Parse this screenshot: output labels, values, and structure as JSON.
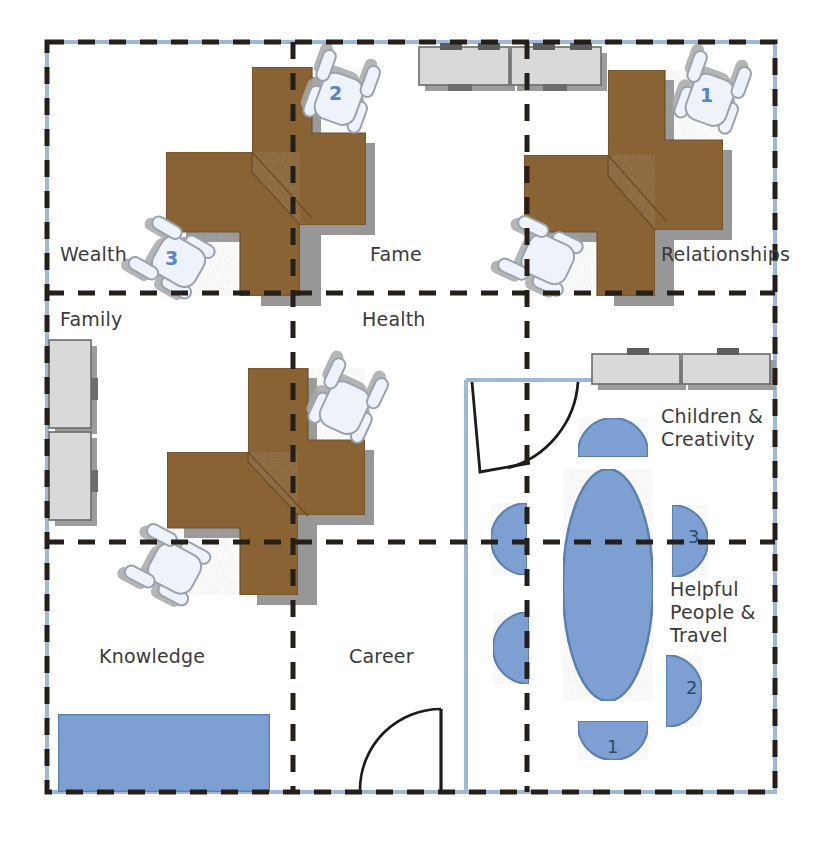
{
  "diagram": {
    "colors": {
      "wall": "#9fb8d8",
      "grid_dash": "#241f18",
      "desk": "#8a6334",
      "desk_shadow": "#8c8c8c",
      "cabinet_fill": "#d9d9d9",
      "cabinet_stroke": "#6b6b6b",
      "chair_fill": "#eef3fb",
      "chair_stroke": "#9aa3ad",
      "chair_shadow": "#a8a8a8",
      "furniture_blue": "#7d9fd2",
      "furniture_blue_stroke": "#5c7fb2",
      "text": "#3b3b3b",
      "chair_number": "#5b85c6",
      "seat_number": "#2e4a6e"
    }
  },
  "bagua_labels": [
    {
      "id": "wealth",
      "text": "Wealth",
      "x": 60,
      "y": 243
    },
    {
      "id": "fame",
      "text": "Fame",
      "x": 370,
      "y": 243
    },
    {
      "id": "relationships",
      "text": "Relationships",
      "x": 661,
      "y": 243
    },
    {
      "id": "family",
      "text": "Family",
      "x": 60,
      "y": 308
    },
    {
      "id": "health",
      "text": "Health",
      "x": 362,
      "y": 308
    },
    {
      "id": "children",
      "text": "Children &\nCreativity",
      "x": 661,
      "y": 405
    },
    {
      "id": "knowledge",
      "text": "Knowledge",
      "x": 99,
      "y": 645
    },
    {
      "id": "career",
      "text": "Career",
      "x": 349,
      "y": 645
    },
    {
      "id": "helpful",
      "text": "Helpful\nPeople &\nTravel",
      "x": 670,
      "y": 578
    }
  ],
  "chair_numbers": [
    {
      "id": "chair-2",
      "text": "2",
      "x": 329,
      "y": 82
    },
    {
      "id": "chair-1",
      "text": "1",
      "x": 700,
      "y": 84
    },
    {
      "id": "chair-3",
      "text": "3",
      "x": 165,
      "y": 247
    }
  ],
  "seat_numbers": [
    {
      "id": "seat-3",
      "text": "3",
      "x": 688,
      "y": 526
    },
    {
      "id": "seat-2",
      "text": "2",
      "x": 686,
      "y": 677
    },
    {
      "id": "seat-1",
      "text": "1",
      "x": 607,
      "y": 736
    }
  ],
  "grid": {
    "outer": {
      "x": 47,
      "y": 42,
      "width": 728,
      "height": 750
    },
    "vertical_lines": [
      293,
      527
    ],
    "horizontal_lines": [
      293,
      542
    ]
  },
  "furniture": {
    "desks": [
      {
        "id": "desk-cluster-top",
        "note": "L-shaped paired workstation, upper area"
      },
      {
        "id": "desk-cluster-right",
        "note": "L-shaped paired workstation, upper right"
      },
      {
        "id": "desk-cluster-middle",
        "note": "L-shaped paired workstation, middle"
      }
    ],
    "cabinets": [
      {
        "id": "cabinet-top-left",
        "note": "credenza along top wall, left"
      },
      {
        "id": "cabinet-top-right",
        "note": "credenza along top wall, right"
      },
      {
        "id": "cabinet-left-upper",
        "note": "cabinet along left wall, upper"
      },
      {
        "id": "cabinet-left-lower",
        "note": "cabinet along left wall, lower"
      },
      {
        "id": "cabinet-right-a",
        "note": "credenza along right room top wall, left"
      },
      {
        "id": "cabinet-right-b",
        "note": "credenza along right room top wall, right"
      }
    ],
    "chairs": [
      {
        "id": "task-chair-2",
        "note": "task chair labelled 2"
      },
      {
        "id": "task-chair-1",
        "note": "task chair labelled 1"
      },
      {
        "id": "task-chair-3",
        "note": "task chair labelled 3"
      },
      {
        "id": "task-chair-fame",
        "note": "task chair in Fame/Relationships area"
      },
      {
        "id": "task-chair-health",
        "note": "task chair in Health area"
      },
      {
        "id": "task-chair-knowledge",
        "note": "task chair in Knowledge area"
      }
    ],
    "conference": {
      "id": "conference-table",
      "note": "oval conference table with six rounded seats"
    },
    "sofa": {
      "id": "sofa-knowledge",
      "note": "blue sofa along bottom wall of Knowledge"
    },
    "doors": [
      {
        "id": "door-career",
        "note": "swing door at bottom of Career area"
      },
      {
        "id": "door-right-room",
        "note": "swing door into right meeting room"
      }
    ]
  }
}
